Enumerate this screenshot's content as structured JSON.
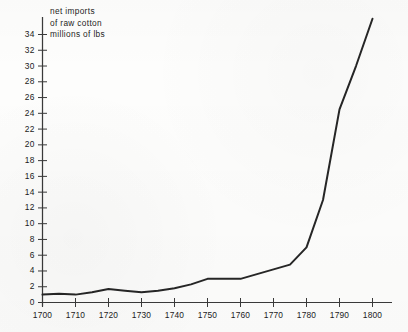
{
  "figure": {
    "caption_lines": [
      "net  imports",
      "of  raw  cotton",
      "millions  of  lbs"
    ],
    "ink_color": "#262626",
    "axis_color": "#3a3a3a",
    "paper_color": "#fdfdfc"
  },
  "chart_data": {
    "type": "line",
    "title": "net imports of raw cotton millions of lbs",
    "xlabel": "",
    "ylabel": "millions of lbs",
    "xlim": [
      1700,
      1800
    ],
    "ylim": [
      0,
      36
    ],
    "grid": false,
    "legend": "none",
    "xticks": [
      1700,
      1710,
      1720,
      1730,
      1740,
      1750,
      1760,
      1770,
      1780,
      1790,
      1800
    ],
    "xtick_labels": [
      "1700",
      "1710",
      "1720",
      "1730",
      "1740",
      "1750",
      "1760",
      "1770",
      "1780",
      "1790",
      "1800"
    ],
    "yticks": [
      0,
      2,
      4,
      6,
      8,
      10,
      12,
      14,
      16,
      18,
      20,
      22,
      24,
      26,
      28,
      30,
      32,
      34
    ],
    "ytick_labels": [
      "0",
      "2",
      "4",
      "6",
      "8",
      "10",
      "12",
      "14",
      "16",
      "18",
      "20",
      "22",
      "24",
      "26",
      "28",
      "30",
      "32",
      "34"
    ],
    "x": [
      1700,
      1705,
      1710,
      1715,
      1720,
      1725,
      1730,
      1735,
      1740,
      1745,
      1750,
      1755,
      1760,
      1765,
      1770,
      1775,
      1780,
      1785,
      1790,
      1795,
      1800
    ],
    "values": [
      1.0,
      1.1,
      1.0,
      1.3,
      1.7,
      1.5,
      1.3,
      1.5,
      1.8,
      2.3,
      3.0,
      3.0,
      3.0,
      3.6,
      4.2,
      4.8,
      7.0,
      13.0,
      24.5,
      30.0,
      36.0
    ],
    "series": [
      {
        "name": "net imports of raw cotton",
        "values": [
          1.0,
          1.1,
          1.0,
          1.3,
          1.7,
          1.5,
          1.3,
          1.5,
          1.8,
          2.3,
          3.0,
          3.0,
          3.0,
          3.6,
          4.2,
          4.8,
          7.0,
          13.0,
          24.5,
          30.0,
          36.0
        ]
      }
    ]
  }
}
